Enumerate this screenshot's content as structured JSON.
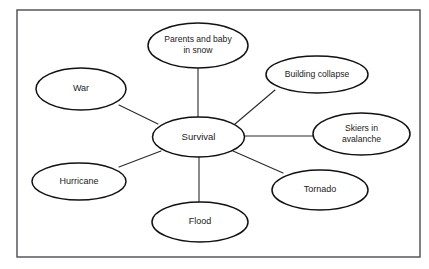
{
  "diagram": {
    "type": "mind-map",
    "frame": {
      "x": 17,
      "y": 10,
      "width": 403,
      "height": 247
    },
    "colors": {
      "background": "#ffffff",
      "node_stroke": "#111111",
      "edge_stroke": "#2a2a2a",
      "frame_stroke": "#4a4a52",
      "text": "#1a1a1a"
    },
    "center": {
      "id": "survival",
      "label": "Survival",
      "cx": 198.5,
      "cy": 137,
      "rx": 46,
      "ry": 20,
      "font_size": 9.5
    },
    "nodes": [
      {
        "id": "parents-and-baby-in-snow",
        "label_line1": "Parents and baby",
        "label_line2": "in snow",
        "cx": 198,
        "cy": 45.5,
        "rx": 50,
        "ry": 22.5,
        "font_size": 8.6
      },
      {
        "id": "building-collapse",
        "label_line1": "Building collapse",
        "label_line2": "",
        "cx": 317,
        "cy": 74.5,
        "rx": 51,
        "ry": 18.5,
        "font_size": 8.6
      },
      {
        "id": "skiers-in-avalanche",
        "label_line1": "Skiers in",
        "label_line2": "avalanche",
        "cx": 361.5,
        "cy": 134,
        "rx": 48.5,
        "ry": 21,
        "font_size": 8.6
      },
      {
        "id": "tornado",
        "label_line1": "Tornado",
        "label_line2": "",
        "cx": 320,
        "cy": 190,
        "rx": 48,
        "ry": 20,
        "font_size": 9
      },
      {
        "id": "flood",
        "label_line1": "Flood",
        "label_line2": "",
        "cx": 200,
        "cy": 222,
        "rx": 48,
        "ry": 20,
        "font_size": 9
      },
      {
        "id": "hurricane",
        "label_line1": "Hurricane",
        "label_line2": "",
        "cx": 79,
        "cy": 181.5,
        "rx": 47,
        "ry": 18.5,
        "font_size": 9
      },
      {
        "id": "war",
        "label_line1": "War",
        "label_line2": "",
        "cx": 81,
        "cy": 89,
        "rx": 45,
        "ry": 21,
        "font_size": 9
      }
    ],
    "edges": [
      {
        "id": "survival-parents",
        "from": "survival",
        "to": "parents-and-baby-in-snow",
        "x1": 198,
        "y1": 117,
        "x2": 198,
        "y2": 68
      },
      {
        "id": "survival-building",
        "from": "survival",
        "to": "building-collapse",
        "x1": 235,
        "y1": 124,
        "x2": 275,
        "y2": 90
      },
      {
        "id": "survival-skiers",
        "from": "survival",
        "to": "skiers-in-avalanche",
        "x1": 245,
        "y1": 136,
        "x2": 313,
        "y2": 136
      },
      {
        "id": "survival-tornado",
        "from": "survival",
        "to": "tornado",
        "x1": 233,
        "y1": 151,
        "x2": 283,
        "y2": 173
      },
      {
        "id": "survival-flood",
        "from": "survival",
        "to": "flood",
        "x1": 199,
        "y1": 157,
        "x2": 199,
        "y2": 202
      },
      {
        "id": "survival-hurricane",
        "from": "survival",
        "to": "hurricane",
        "x1": 161,
        "y1": 151,
        "x2": 119,
        "y2": 167
      },
      {
        "id": "survival-war",
        "from": "survival",
        "to": "war",
        "x1": 158,
        "y1": 124,
        "x2": 119,
        "y2": 105
      }
    ]
  }
}
